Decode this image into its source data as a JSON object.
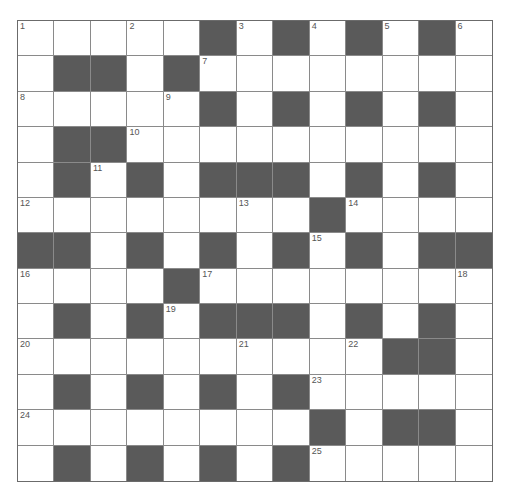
{
  "puzzle": {
    "rows": 13,
    "cols": 13,
    "colors": {
      "block": "#5a5a5a",
      "cell": "#ffffff",
      "line": "#8a8a8a"
    },
    "grid": [
      ".....#.#.#.#.",
      ".##.#........",
      ".....#.#.#.#.",
      ".##..........",
      ".#.#.###.#.#.",
      "........#....",
      "##.#.#.#.#.##",
      "....#........",
      ".#.#.###.#.#.",
      "..........##.",
      ".#.#.#.#.....",
      "........#.##.",
      ".#.#.#.#....."
    ],
    "numbers": [
      {
        "r": 0,
        "c": 0,
        "n": "1"
      },
      {
        "r": 0,
        "c": 3,
        "n": "2"
      },
      {
        "r": 0,
        "c": 6,
        "n": "3"
      },
      {
        "r": 0,
        "c": 8,
        "n": "4"
      },
      {
        "r": 0,
        "c": 10,
        "n": "5"
      },
      {
        "r": 0,
        "c": 12,
        "n": "6"
      },
      {
        "r": 1,
        "c": 5,
        "n": "7"
      },
      {
        "r": 2,
        "c": 0,
        "n": "8"
      },
      {
        "r": 2,
        "c": 4,
        "n": "9"
      },
      {
        "r": 3,
        "c": 3,
        "n": "10"
      },
      {
        "r": 4,
        "c": 2,
        "n": "11"
      },
      {
        "r": 5,
        "c": 0,
        "n": "12"
      },
      {
        "r": 5,
        "c": 6,
        "n": "13"
      },
      {
        "r": 5,
        "c": 9,
        "n": "14"
      },
      {
        "r": 6,
        "c": 8,
        "n": "15"
      },
      {
        "r": 7,
        "c": 0,
        "n": "16"
      },
      {
        "r": 7,
        "c": 5,
        "n": "17"
      },
      {
        "r": 7,
        "c": 12,
        "n": "18"
      },
      {
        "r": 8,
        "c": 4,
        "n": "19"
      },
      {
        "r": 9,
        "c": 0,
        "n": "20"
      },
      {
        "r": 9,
        "c": 6,
        "n": "21"
      },
      {
        "r": 9,
        "c": 9,
        "n": "22"
      },
      {
        "r": 10,
        "c": 8,
        "n": "23"
      },
      {
        "r": 11,
        "c": 0,
        "n": "24"
      },
      {
        "r": 12,
        "c": 8,
        "n": "25"
      }
    ]
  }
}
